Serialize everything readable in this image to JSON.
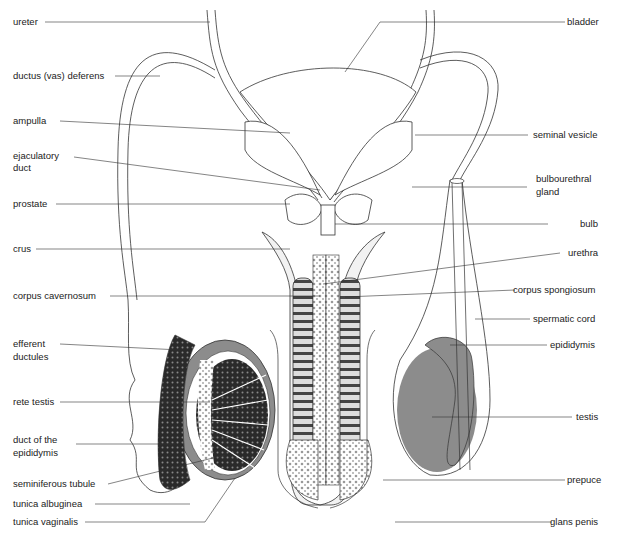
{
  "diagram": {
    "colors": {
      "line": "#333333",
      "tissue_gray": "#8c8c8c",
      "dark_tissue": "#2a2a2a",
      "background": "#ffffff"
    },
    "labels_left": [
      {
        "id": "ureter",
        "text": "ureter"
      },
      {
        "id": "ductus",
        "text": "ductus (vas) deferens"
      },
      {
        "id": "ampulla",
        "text": "ampulla"
      },
      {
        "id": "ejaculatory1",
        "text": "ejaculatory"
      },
      {
        "id": "ejaculatory2",
        "text": "duct"
      },
      {
        "id": "prostate",
        "text": "prostate"
      },
      {
        "id": "crus",
        "text": "crus"
      },
      {
        "id": "corpus_cavernosum",
        "text": "corpus cavernosum"
      },
      {
        "id": "efferent1",
        "text": "efferent"
      },
      {
        "id": "efferent2",
        "text": "ductules"
      },
      {
        "id": "rete_testis",
        "text": "rete testis"
      },
      {
        "id": "duct_epi1",
        "text": "duct of the"
      },
      {
        "id": "duct_epi2",
        "text": "epididymis"
      },
      {
        "id": "seminiferous",
        "text": "seminiferous tubule"
      },
      {
        "id": "tunica_albuginea",
        "text": "tunica albuginea"
      },
      {
        "id": "tunica_vaginalis",
        "text": "tunica vaginalis"
      }
    ],
    "labels_right": [
      {
        "id": "bladder",
        "text": "bladder"
      },
      {
        "id": "seminal_vesicle",
        "text": "seminal vesicle"
      },
      {
        "id": "bulbourethral1",
        "text": "bulbourethral"
      },
      {
        "id": "bulbourethral2",
        "text": "gland"
      },
      {
        "id": "bulb",
        "text": "bulb"
      },
      {
        "id": "urethra",
        "text": "urethra"
      },
      {
        "id": "corpus_spongiosum",
        "text": "corpus spongiosum"
      },
      {
        "id": "spermatic_cord",
        "text": "spermatic cord"
      },
      {
        "id": "epididymis",
        "text": "epididymis"
      },
      {
        "id": "testis",
        "text": "testis"
      },
      {
        "id": "prepuce",
        "text": "prepuce"
      },
      {
        "id": "glans_penis",
        "text": "glans penis"
      }
    ]
  }
}
